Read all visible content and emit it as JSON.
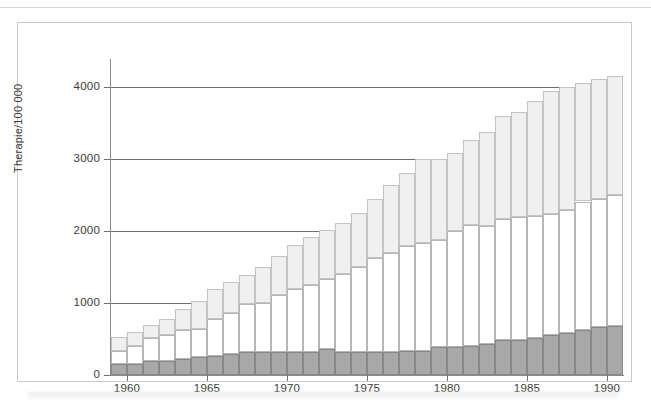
{
  "figure": {
    "y_axis_title": "Therapie/100 000"
  },
  "legend": {
    "diet": "allein mit Diät",
    "oral": "mit oralen\nAntidiabetika",
    "insulin": "mit Insulin"
  },
  "colors": {
    "insulin": "#a8a8a8",
    "oral": "#ffffff",
    "diet": "#f0f0f0",
    "axis": "#6f6f6f",
    "frame": "#c9c9c9",
    "text": "#3b3b3b"
  },
  "chart_data": {
    "type": "bar",
    "stacked": true,
    "title": "",
    "xlabel": "",
    "ylabel": "Therapie/100 000",
    "ylim": [
      0,
      4400
    ],
    "yticks": [
      0,
      1000,
      2000,
      3000,
      4000
    ],
    "ytick_labels": [
      "0",
      "1000",
      "2000",
      "3000",
      "4000"
    ],
    "xticks": [
      1960,
      1965,
      1970,
      1975,
      1980,
      1985,
      1990
    ],
    "xtick_labels": [
      "1960",
      "1965",
      "1970",
      "1975",
      "1980",
      "1985",
      "1990"
    ],
    "grid": "horizontal",
    "legend_position": "inside-right",
    "categories": [
      1959,
      1960,
      1961,
      1962,
      1963,
      1964,
      1965,
      1966,
      1967,
      1968,
      1969,
      1970,
      1971,
      1972,
      1973,
      1974,
      1975,
      1976,
      1977,
      1978,
      1979,
      1980,
      1981,
      1982,
      1983,
      1984,
      1985,
      1986,
      1987,
      1988,
      1989,
      1990
    ],
    "series": [
      {
        "name": "mit Insulin",
        "color": "#a8a8a8",
        "values": [
          150,
          150,
          195,
          195,
          225,
          245,
          270,
          295,
          320,
          320,
          320,
          320,
          320,
          360,
          315,
          320,
          320,
          325,
          330,
          340,
          390,
          390,
          400,
          430,
          480,
          480,
          510,
          560,
          590,
          620,
          660,
          680
        ]
      },
      {
        "name": "mit orale Antidiabetika",
        "color": "#ffffff",
        "values": [
          180,
          250,
          320,
          360,
          400,
          400,
          510,
          570,
          670,
          680,
          790,
          880,
          930,
          980,
          1090,
          1175,
          1300,
          1375,
          1460,
          1500,
          1490,
          1610,
          1680,
          1640,
          1690,
          1710,
          1700,
          1670,
          1700,
          1790,
          1780,
          1820
        ]
      },
      {
        "name": "allein mit Diät",
        "color": "#f0f0f0",
        "values": [
          200,
          200,
          180,
          230,
          290,
          380,
          420,
          430,
          405,
          505,
          540,
          600,
          670,
          680,
          700,
          760,
          820,
          940,
          1010,
          1160,
          1120,
          1090,
          1190,
          1310,
          1430,
          1470,
          1590,
          1710,
          1710,
          1640,
          1670,
          1650
        ]
      }
    ]
  }
}
